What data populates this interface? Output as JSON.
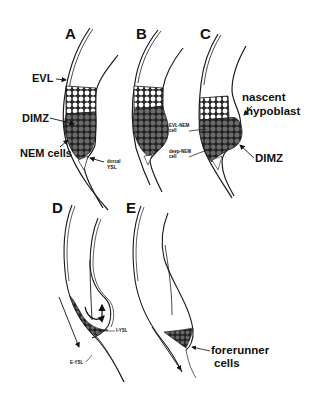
{
  "figure": {
    "panels": [
      {
        "id": "A",
        "labels": [
          "EVL",
          "DIMZ",
          "NEM cells",
          "dorsal YSL"
        ]
      },
      {
        "id": "B",
        "labels": []
      },
      {
        "id": "C",
        "labels": [
          "EVL-NEM cell",
          "deep-NEM cell",
          "nascent hypoblast",
          "DIMZ"
        ]
      },
      {
        "id": "D",
        "labels": [
          "I-YSL",
          "E-YSL"
        ]
      },
      {
        "id": "E",
        "labels": [
          "forerunner cells"
        ]
      }
    ],
    "panel_A": {
      "letter": "A",
      "evl": "EVL",
      "dimz": "DIMZ",
      "nem_cells": "NEM cells",
      "dorsal_ysl_1": "dorsal",
      "dorsal_ysl_2": "YSL"
    },
    "panel_B": {
      "letter": "B"
    },
    "panel_C": {
      "letter": "C",
      "evl_nem_1": "EVL-NEM",
      "evl_nem_2": "cell",
      "deep_nem_1": "deep-NEM",
      "deep_nem_2": "cell",
      "nascent": "nascent",
      "hypoblast": "hypoblast",
      "dimz": "DIMZ"
    },
    "panel_D": {
      "letter": "D",
      "i_ysl": "I-YSL",
      "e_ysl": "E-YSL"
    },
    "panel_E": {
      "letter": "E",
      "forerunner": "forerunner",
      "cells": "cells"
    },
    "colors": {
      "line": "#1a1a1a",
      "cell_dark": "#5a5a5a",
      "cell_light": "#ffffff",
      "background": "#ffffff"
    }
  }
}
